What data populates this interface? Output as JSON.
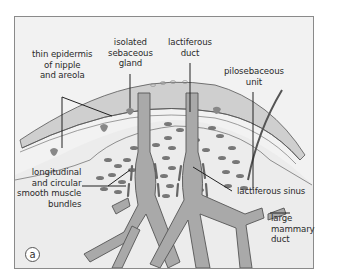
{
  "figure": {
    "panel_label": "a",
    "colors": {
      "background": "#f2f2f2",
      "frame": "#8a8a8a",
      "skin": "#cfcfcf",
      "duct_fill": "#a9a9a9",
      "duct_outline": "#555555",
      "muscle": "#777777",
      "leader_line": "#222222"
    },
    "labels": {
      "thin_epidermis": [
        "thin epidermis",
        "of nipple",
        "and areola"
      ],
      "sebaceous_gland": [
        "isolated",
        "sebaceous",
        "gland"
      ],
      "lactiferous_duct": [
        "lactiferous",
        "duct"
      ],
      "pilosebaceous_unit": [
        "pilosebaceous",
        "unit"
      ],
      "smooth_muscle": [
        "longitudinal",
        "and circular",
        "smooth muscle",
        "bundles"
      ],
      "lactiferous_sinus": "lactiferous sinus",
      "large_mammary_duct": [
        "large",
        "mammary",
        "duct"
      ]
    }
  }
}
